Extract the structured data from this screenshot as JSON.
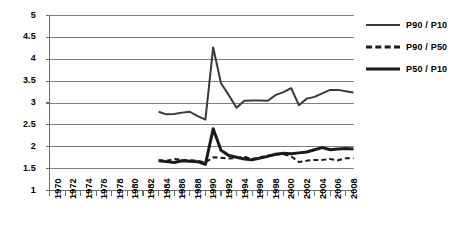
{
  "chart_data": {
    "type": "line",
    "title": "",
    "xlabel": "",
    "ylabel": "",
    "xlim": [
      1970,
      2009
    ],
    "ylim": [
      1,
      5
    ],
    "ytick_labels": [
      "5",
      "4.5",
      "4",
      "3.5",
      "3",
      "2.5",
      "2",
      "1.5",
      "1"
    ],
    "ytick_values": [
      5,
      4.5,
      4,
      3.5,
      3,
      2.5,
      2,
      1.5,
      1
    ],
    "xtick_labels": [
      "1970",
      "1972",
      "1974",
      "1976",
      "1978",
      "1980",
      "1982",
      "1984",
      "1986",
      "1988",
      "1990",
      "1992",
      "1994",
      "1996",
      "1998",
      "2000",
      "2002",
      "2004",
      "2006",
      "2008"
    ],
    "xtick_values": [
      1970,
      1972,
      1974,
      1976,
      1978,
      1980,
      1982,
      1984,
      1986,
      1988,
      1990,
      1992,
      1994,
      1996,
      1998,
      2000,
      2002,
      2004,
      2006,
      2008
    ],
    "grid": true,
    "grid_axis": "y",
    "grid_color": "#808080",
    "legend_position": "right",
    "series": [
      {
        "name": "P90 / P10",
        "style": "solid",
        "color": "#3a3a3a",
        "width": 2,
        "x": [
          1984,
          1985,
          1986,
          1987,
          1988,
          1989,
          1990,
          1991,
          1992,
          1993,
          1994,
          1995,
          1996,
          1997,
          1998,
          1999,
          2000,
          2001,
          2002,
          2003,
          2004,
          2005,
          2006,
          2007,
          2008,
          2009
        ],
        "values": [
          2.8,
          2.74,
          2.75,
          2.78,
          2.8,
          2.7,
          2.62,
          4.27,
          3.45,
          3.18,
          2.89,
          3.05,
          3.06,
          3.06,
          3.05,
          3.18,
          3.25,
          3.34,
          2.95,
          3.1,
          3.14,
          3.22,
          3.3,
          3.3,
          3.27,
          3.24
        ]
      },
      {
        "name": "P90 / P50",
        "style": "dashed",
        "color": "#1a1a1a",
        "width": 2,
        "x": [
          1984,
          1985,
          1986,
          1987,
          1988,
          1989,
          1990,
          1991,
          1992,
          1993,
          1994,
          1995,
          1996,
          1997,
          1998,
          1999,
          2000,
          2001,
          2002,
          2003,
          2004,
          2005,
          2006,
          2007,
          2008,
          2009
        ],
        "values": [
          1.69,
          1.68,
          1.72,
          1.7,
          1.69,
          1.68,
          1.64,
          1.76,
          1.75,
          1.73,
          1.74,
          1.77,
          1.72,
          1.76,
          1.8,
          1.82,
          1.83,
          1.78,
          1.65,
          1.68,
          1.7,
          1.7,
          1.72,
          1.69,
          1.74,
          1.74
        ]
      },
      {
        "name": "P50 / P10",
        "style": "solid",
        "color": "#1a1a1a",
        "width": 3,
        "x": [
          1984,
          1985,
          1986,
          1987,
          1988,
          1989,
          1990,
          1991,
          1992,
          1993,
          1994,
          1995,
          1996,
          1997,
          1998,
          1999,
          2000,
          2001,
          2002,
          2003,
          2004,
          2005,
          2006,
          2007,
          2008,
          2009
        ],
        "values": [
          1.68,
          1.66,
          1.64,
          1.68,
          1.67,
          1.66,
          1.6,
          2.41,
          1.92,
          1.8,
          1.76,
          1.72,
          1.7,
          1.74,
          1.78,
          1.83,
          1.85,
          1.84,
          1.86,
          1.88,
          1.93,
          1.98,
          1.93,
          1.95,
          1.96,
          1.95
        ]
      }
    ]
  },
  "legend": {
    "items": [
      {
        "label": "P90 / P10",
        "style": "solid-thin"
      },
      {
        "label": "P90 / P50",
        "style": "dashed"
      },
      {
        "label": "P50 / P10",
        "style": "solid-thick"
      }
    ]
  }
}
